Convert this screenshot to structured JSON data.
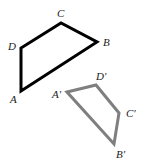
{
  "diagram": {
    "type": "geometric-transformation",
    "original": {
      "name": "ABCD",
      "stroke": "#000000",
      "stroke_width": 3,
      "vertices": [
        {
          "label": "A",
          "x": 21,
          "y": 91,
          "label_x": 10,
          "label_y": 103
        },
        {
          "label": "B",
          "x": 97,
          "y": 42,
          "label_x": 103,
          "label_y": 46
        },
        {
          "label": "C",
          "x": 61,
          "y": 23,
          "label_x": 57,
          "label_y": 17
        },
        {
          "label": "D",
          "x": 21,
          "y": 48,
          "label_x": 8,
          "label_y": 50
        }
      ],
      "points": "21,91 97,42 61,23 21,48"
    },
    "image": {
      "name": "A'B'C'D'",
      "stroke": "#7f7f7f",
      "stroke_width": 3,
      "vertices": [
        {
          "label": "A'",
          "x": 67,
          "y": 92,
          "label_x": 52,
          "label_y": 98
        },
        {
          "label": "B'",
          "x": 114,
          "y": 144,
          "label_x": 116,
          "label_y": 158
        },
        {
          "label": "C'",
          "x": 119,
          "y": 113,
          "label_x": 126,
          "label_y": 117
        },
        {
          "label": "D'",
          "x": 96,
          "y": 85,
          "label_x": 96,
          "label_y": 80
        }
      ],
      "points": "67,92 96,85 119,113 114,144"
    }
  }
}
